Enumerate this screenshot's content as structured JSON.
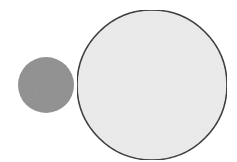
{
  "diagram": {
    "width": 237,
    "height": 162,
    "background": "#ffffff",
    "shapes": [
      {
        "id": "small-circle",
        "type": "circle",
        "cx": 46,
        "cy": 85,
        "r": 28,
        "fill": "#8f8f8f",
        "stroke": "none"
      },
      {
        "id": "large-circle",
        "type": "circle",
        "cx": 152,
        "cy": 85,
        "r": 75,
        "fill": "#ececec",
        "stroke": "#2b2b2b",
        "stroke_width": 1.5
      }
    ]
  }
}
